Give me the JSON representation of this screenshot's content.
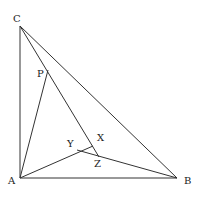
{
  "diagram": {
    "type": "geometry",
    "stroke_color": "#333333",
    "points": {
      "A": {
        "label": "A",
        "x": 20,
        "y": 178
      },
      "B": {
        "label": "B",
        "x": 177,
        "y": 178
      },
      "C": {
        "label": "C",
        "x": 20,
        "y": 26
      },
      "P": {
        "label": "P",
        "x": 48,
        "y": 70
      },
      "X": {
        "label": "X",
        "x": 93,
        "y": 146
      },
      "Y": {
        "label": "Y",
        "x": 77,
        "y": 150
      },
      "Z": {
        "label": "Z",
        "x": 99,
        "y": 157
      }
    },
    "segments": [
      [
        "A",
        "B"
      ],
      [
        "A",
        "C"
      ],
      [
        "C",
        "B"
      ],
      [
        "C",
        "Z"
      ],
      [
        "A",
        "P"
      ],
      [
        "A",
        "X"
      ],
      [
        "Y",
        "B"
      ]
    ]
  }
}
